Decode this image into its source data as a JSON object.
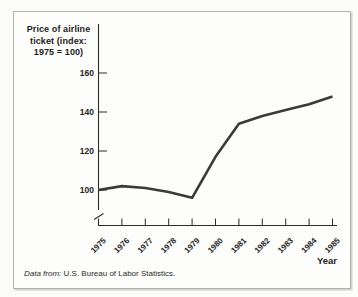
{
  "chart": {
    "title_lines": [
      "Price of airline",
      "ticket (index:",
      "1975 = 100)"
    ],
    "xlabel": "Year"
  },
  "source": {
    "prefix": "Data from:",
    "text": "U.S. Bureau of Labor Statistics."
  },
  "colors": {
    "line": "#3a3a3a",
    "axis": "#2b2b2b",
    "text": "#1c1c1c",
    "frame_border": "#b2b2b0",
    "background": "#fdfdfb"
  },
  "chart_data": {
    "type": "line",
    "title": "Price of airline ticket (index: 1975 = 100)",
    "xlabel": "Year",
    "ylabel": "Price of airline ticket (index: 1975 = 100)",
    "x": [
      1975,
      1976,
      1977,
      1978,
      1979,
      1980,
      1981,
      1982,
      1983,
      1984,
      1985
    ],
    "values": [
      100,
      102,
      101,
      99,
      96,
      117,
      134,
      138,
      141,
      144,
      148
    ],
    "yticks": [
      100,
      120,
      140,
      160
    ],
    "y_axis_break": true,
    "grid": false,
    "legend": "none",
    "source_note": "Data from: U.S. Bureau of Labor Statistics."
  }
}
